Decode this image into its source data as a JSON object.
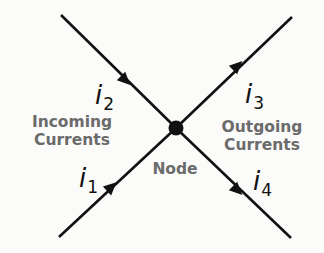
{
  "diagram": {
    "node": {
      "label": "Node",
      "x": 176,
      "y": 128,
      "r": 7
    },
    "groups": {
      "incoming": {
        "line1": "Incoming",
        "line2": "Currents"
      },
      "outgoing": {
        "line1": "Outgoing",
        "line2": "Currents"
      }
    },
    "currents": [
      {
        "symbol": "i",
        "sub": "1",
        "direction": "incoming",
        "from": [
          59,
          237
        ],
        "to": [
          176,
          128
        ]
      },
      {
        "symbol": "i",
        "sub": "2",
        "direction": "incoming",
        "from": [
          61,
          15
        ],
        "to": [
          176,
          128
        ]
      },
      {
        "symbol": "i",
        "sub": "3",
        "direction": "outgoing",
        "from": [
          176,
          128
        ],
        "to": [
          292,
          17
        ]
      },
      {
        "symbol": "i",
        "sub": "4",
        "direction": "outgoing",
        "from": [
          176,
          128
        ],
        "to": [
          291,
          238
        ]
      }
    ],
    "colors": {
      "line": "#111111",
      "label": "#6b6b6b",
      "background": "#fbfbfa"
    }
  }
}
